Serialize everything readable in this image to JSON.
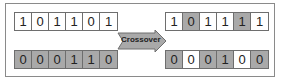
{
  "diagram": {
    "title": "Crossover",
    "arrow_label": "Crossover",
    "colors": {
      "gene_white": "#ffffff",
      "gene_gray": "#a9a9a9",
      "arrow_fill": "#a9a9a9",
      "border": "#6e6e6e"
    },
    "parents": [
      {
        "id": "parent-1",
        "genes": [
          "1",
          "0",
          "1",
          "1",
          "0",
          "1"
        ],
        "shading": [
          "white",
          "white",
          "white",
          "white",
          "white",
          "white"
        ]
      },
      {
        "id": "parent-2",
        "genes": [
          "0",
          "0",
          "0",
          "1",
          "1",
          "0"
        ],
        "shading": [
          "gray",
          "gray",
          "gray",
          "gray",
          "gray",
          "gray"
        ]
      }
    ],
    "children": [
      {
        "id": "child-1",
        "genes": [
          "1",
          "0",
          "1",
          "1",
          "1",
          "1"
        ],
        "shading": [
          "white",
          "gray",
          "white",
          "white",
          "gray",
          "white"
        ]
      },
      {
        "id": "child-2",
        "genes": [
          "0",
          "0",
          "0",
          "1",
          "0",
          "0"
        ],
        "shading": [
          "gray",
          "white",
          "gray",
          "gray",
          "white",
          "gray"
        ]
      }
    ]
  }
}
